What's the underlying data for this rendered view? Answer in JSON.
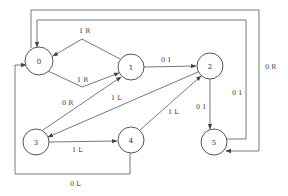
{
  "diagram": {
    "type": "state-transition-diagram",
    "nodes": [
      {
        "id": "0",
        "label": "0",
        "x": 39,
        "y": 61
      },
      {
        "id": "1",
        "label": "1",
        "x": 131,
        "y": 67
      },
      {
        "id": "2",
        "label": "2",
        "x": 210,
        "y": 66
      },
      {
        "id": "3",
        "label": "3",
        "x": 36,
        "y": 142
      },
      {
        "id": "4",
        "label": "4",
        "x": 131,
        "y": 140
      },
      {
        "id": "5",
        "label": "5",
        "x": 214,
        "y": 142
      }
    ],
    "edges": [
      {
        "from": "1",
        "to": "0",
        "label": "1 R"
      },
      {
        "from": "0",
        "to": "1",
        "label": "1 R"
      },
      {
        "from": "1",
        "to": "2",
        "label": "0 1"
      },
      {
        "from": "3",
        "to": "1",
        "label": "0 R"
      },
      {
        "from": "2",
        "to": "3",
        "label": "1 L"
      },
      {
        "from": "4",
        "to": "2",
        "label": "1 L"
      },
      {
        "from": "3",
        "to": "4",
        "label": "1 L"
      },
      {
        "from": "2",
        "to": "5",
        "label": "0 1"
      },
      {
        "from": "5",
        "to": "0",
        "label": "0 1"
      },
      {
        "from": "0",
        "to": "5",
        "label": "0 R"
      },
      {
        "from": "4",
        "to": "0",
        "label": "0 L"
      }
    ]
  }
}
